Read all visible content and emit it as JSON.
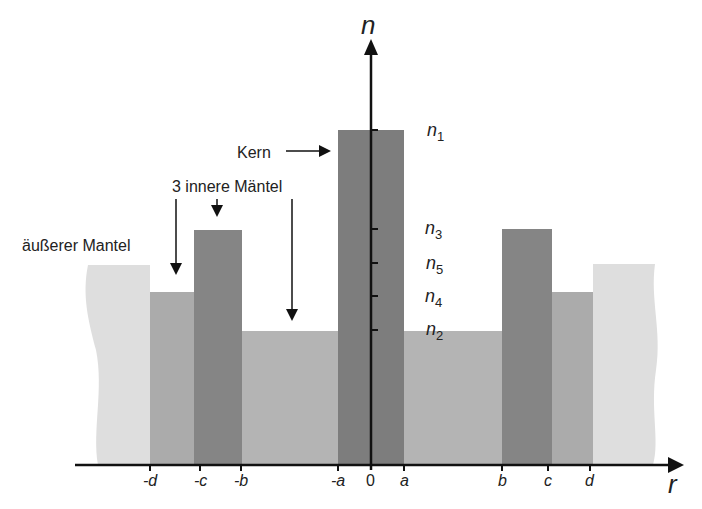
{
  "diagram": {
    "axes": {
      "y_label": "n",
      "x_label": "r",
      "x_ticks": [
        "-d",
        "-c",
        "-b",
        "-a",
        "0",
        "a",
        "b",
        "c",
        "d"
      ],
      "y_ticks": [
        {
          "base": "n",
          "sub": "1"
        },
        {
          "base": "n",
          "sub": "3"
        },
        {
          "base": "n",
          "sub": "5"
        },
        {
          "base": "n",
          "sub": "4"
        },
        {
          "base": "n",
          "sub": "2"
        }
      ]
    },
    "annotations": {
      "core": "Kern",
      "inner_cladding": "3 innere Mäntel",
      "outer_cladding": "äußerer Mantel"
    },
    "colors": {
      "core": "#7d7d7d",
      "ring_n3": "#858585",
      "ring_n4": "#ababab",
      "ring_n2": "#b4b4b4",
      "outer": "#dedede",
      "axis": "#111111"
    }
  }
}
